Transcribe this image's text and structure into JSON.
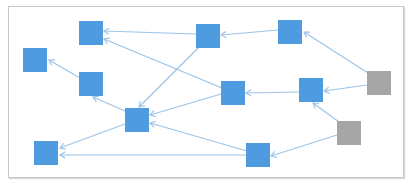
{
  "diagram": {
    "type": "directed-graph",
    "colors": {
      "primary_node": "#4f9be0",
      "source_node": "#a6a6a6",
      "edge": "#9cc4e8",
      "frame": "#c8c8c8"
    },
    "nodes": [
      {
        "id": "A",
        "kind": "primary",
        "x": 23,
        "y": 48,
        "w": 24,
        "h": 24
      },
      {
        "id": "B",
        "kind": "primary",
        "x": 79,
        "y": 21,
        "w": 24,
        "h": 24
      },
      {
        "id": "C",
        "kind": "primary",
        "x": 79,
        "y": 72,
        "w": 24,
        "h": 24
      },
      {
        "id": "D",
        "kind": "primary",
        "x": 196,
        "y": 24,
        "w": 24,
        "h": 24
      },
      {
        "id": "E",
        "kind": "primary",
        "x": 278,
        "y": 20,
        "w": 24,
        "h": 24
      },
      {
        "id": "F",
        "kind": "primary",
        "x": 221,
        "y": 81,
        "w": 24,
        "h": 24
      },
      {
        "id": "G",
        "kind": "primary",
        "x": 299,
        "y": 78,
        "w": 24,
        "h": 24
      },
      {
        "id": "H",
        "kind": "source",
        "x": 367,
        "y": 71,
        "w": 24,
        "h": 24
      },
      {
        "id": "I",
        "kind": "source",
        "x": 337,
        "y": 121,
        "w": 24,
        "h": 24
      },
      {
        "id": "J",
        "kind": "primary",
        "x": 125,
        "y": 108,
        "w": 24,
        "h": 24
      },
      {
        "id": "K",
        "kind": "primary",
        "x": 34,
        "y": 141,
        "w": 24,
        "h": 24
      },
      {
        "id": "L",
        "kind": "primary",
        "x": 246,
        "y": 143,
        "w": 24,
        "h": 24
      }
    ],
    "edges": [
      {
        "from": "D",
        "to": "B",
        "x1": 196,
        "y1": 34,
        "x2": 104,
        "y2": 31
      },
      {
        "from": "F",
        "to": "B",
        "x1": 222,
        "y1": 88,
        "x2": 104,
        "y2": 39
      },
      {
        "from": "D",
        "to": "J",
        "x1": 199,
        "y1": 47,
        "x2": 139,
        "y2": 107
      },
      {
        "from": "C",
        "to": "A",
        "x1": 80,
        "y1": 78,
        "x2": 49,
        "y2": 60
      },
      {
        "from": "J",
        "to": "C",
        "x1": 125,
        "y1": 111,
        "x2": 93,
        "y2": 97
      },
      {
        "from": "F",
        "to": "J",
        "x1": 221,
        "y1": 94,
        "x2": 150,
        "y2": 115
      },
      {
        "from": "E",
        "to": "D",
        "x1": 278,
        "y1": 30,
        "x2": 221,
        "y2": 35
      },
      {
        "from": "H",
        "to": "E",
        "x1": 368,
        "y1": 73,
        "x2": 304,
        "y2": 32
      },
      {
        "from": "G",
        "to": "F",
        "x1": 299,
        "y1": 92,
        "x2": 246,
        "y2": 93
      },
      {
        "from": "H",
        "to": "G",
        "x1": 367,
        "y1": 85,
        "x2": 324,
        "y2": 91
      },
      {
        "from": "I",
        "to": "G",
        "x1": 339,
        "y1": 122,
        "x2": 313,
        "y2": 103
      },
      {
        "from": "J",
        "to": "K",
        "x1": 125,
        "y1": 124,
        "x2": 60,
        "y2": 148
      },
      {
        "from": "L",
        "to": "K",
        "x1": 246,
        "y1": 155,
        "x2": 60,
        "y2": 155
      },
      {
        "from": "L",
        "to": "J",
        "x1": 247,
        "y1": 151,
        "x2": 150,
        "y2": 123
      },
      {
        "from": "I",
        "to": "L",
        "x1": 337,
        "y1": 135,
        "x2": 271,
        "y2": 156
      }
    ]
  }
}
